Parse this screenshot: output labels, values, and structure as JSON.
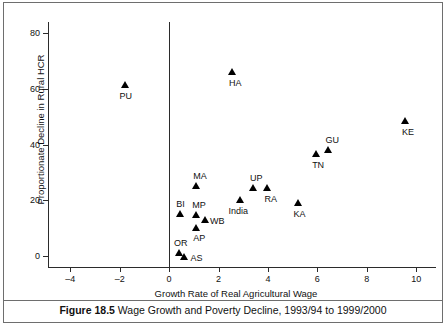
{
  "figure": {
    "caption_label": "Figure 18.5",
    "caption_text": "Wage Growth and Poverty Decline, 1993/94 to 1999/2000"
  },
  "chart_data": {
    "type": "scatter",
    "title": "",
    "xlabel": "Growth Rate of Real Agricultural Wage",
    "ylabel": "Proportionate Decline in Rural HCR",
    "xlim": [
      -4.9,
      10.8
    ],
    "ylim": [
      -4,
      84
    ],
    "xticks": [
      -4,
      -2,
      0,
      2,
      4,
      6,
      8,
      10
    ],
    "xtick_labels": [
      "–4",
      "–2",
      "0",
      "2",
      "4",
      "6",
      "8",
      "10"
    ],
    "yticks": [
      0,
      20,
      40,
      60,
      80
    ],
    "ytick_labels": [
      "0",
      "20",
      "40",
      "60",
      "80"
    ],
    "grid": false,
    "legend": "none",
    "marker": "filled-triangle",
    "reference_line_x": 0,
    "points": [
      {
        "label": "PU",
        "x": -1.8,
        "y": 61.5,
        "label_dx": -5,
        "label_dy": 6
      },
      {
        "label": "HA",
        "x": 2.55,
        "y": 66.0,
        "label_dx": -3,
        "label_dy": 6
      },
      {
        "label": "KE",
        "x": 9.55,
        "y": 48.5,
        "label_dx": -3,
        "label_dy": 6
      },
      {
        "label": "GU",
        "x": 6.45,
        "y": 38.0,
        "label_dx": -3,
        "label_dy": -15
      },
      {
        "label": "TN",
        "x": 5.95,
        "y": 36.5,
        "label_dx": -4,
        "label_dy": 6
      },
      {
        "label": "MA",
        "x": 1.1,
        "y": 25.0,
        "label_dx": -3,
        "label_dy": -15
      },
      {
        "label": "UP",
        "x": 3.4,
        "y": 24.5,
        "label_dx": -3,
        "label_dy": -15
      },
      {
        "label": "RA",
        "x": 3.98,
        "y": 24.5,
        "label_dx": -3,
        "label_dy": 6
      },
      {
        "label": "India",
        "x": 2.85,
        "y": 20.0,
        "label_dx": -11,
        "label_dy": 6
      },
      {
        "label": "KA",
        "x": 5.2,
        "y": 19.0,
        "label_dx": -4,
        "label_dy": 6
      },
      {
        "label": "BI",
        "x": 0.45,
        "y": 15.0,
        "label_dx": -4,
        "label_dy": -15
      },
      {
        "label": "MP",
        "x": 1.1,
        "y": 14.5,
        "label_dx": -4,
        "label_dy": -15
      },
      {
        "label": "WB",
        "x": 1.45,
        "y": 13.0,
        "label_dx": 5,
        "label_dy": -4
      },
      {
        "label": "AP",
        "x": 1.1,
        "y": 10.0,
        "label_dx": -3,
        "label_dy": 5
      },
      {
        "label": "OR",
        "x": 0.4,
        "y": 1.0,
        "label_dx": -5,
        "label_dy": -15
      },
      {
        "label": "AS",
        "x": 0.62,
        "y": -0.4,
        "label_dx": 6,
        "label_dy": -4
      }
    ]
  }
}
